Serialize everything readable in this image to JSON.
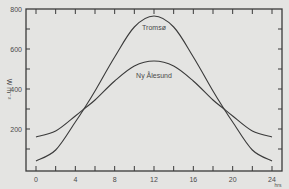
{
  "chart_data": {
    "type": "line",
    "title": "",
    "xlabel": "hrs",
    "ylabel": "W m⁻²",
    "xlim": [
      -1.0,
      25.0
    ],
    "ylim": [
      0,
      800
    ],
    "x_ticks": [
      0,
      4,
      8,
      12,
      16,
      20,
      24
    ],
    "y_ticks": [
      200,
      400,
      600,
      800
    ],
    "grid": false,
    "legend": "inline labels",
    "x": [
      0,
      2,
      4,
      5,
      6,
      8,
      10,
      12,
      14,
      16,
      18,
      19,
      20,
      22,
      24
    ],
    "series": [
      {
        "name": "Tromsø",
        "label_text": "Tromsø",
        "values": [
          40,
          95,
          235,
          310,
          390,
          560,
          710,
          765,
          710,
          560,
          390,
          310,
          235,
          95,
          40
        ]
      },
      {
        "name": "Ny Ålesund",
        "label_text": "Ny Ålesund",
        "values": [
          160,
          190,
          265,
          305,
          345,
          440,
          515,
          540,
          515,
          440,
          345,
          305,
          265,
          190,
          160
        ]
      }
    ]
  }
}
